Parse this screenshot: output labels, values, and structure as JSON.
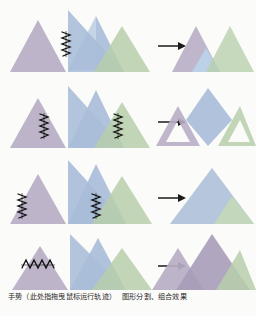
{
  "figure": {
    "title_caption": "手势（此处指拖曳鼠标运行轨迹） 图形分割、组合效果",
    "caption_part_1": "手势（此处指拖曳鼠标运行轨迹）",
    "caption_part_2": "图形分割、组合效果",
    "background_color": "#fbfbf9",
    "rows": [
      {
        "id": "row-1",
        "gesture": "single vertical zigzag scribble on blue triangle left edge",
        "gesture_count": 1,
        "source_shapes": [
          "purple-triangle",
          "blue-triangle",
          "green-triangle"
        ],
        "result_shapes": [
          "purple-triangle-with-blue-wedge",
          "green-triangle"
        ],
        "result_description": "紫色三角形（含蓝色楔形）与绿色三角形"
      },
      {
        "id": "row-2",
        "gesture": "two vertical zigzag scribbles on both blue overlaps",
        "gesture_count": 2,
        "source_shapes": [
          "purple-triangle",
          "blue-triangle",
          "green-triangle"
        ],
        "result_shapes": [
          "purple-outline-triangle",
          "blue-kite",
          "green-outline-triangle"
        ],
        "result_description": "蓝色菱形被分离，紫色与绿色成轮廓三角形"
      },
      {
        "id": "row-3",
        "gesture": "two vertical zigzag scribbles at outer left and right",
        "gesture_count": 2,
        "source_shapes": [
          "purple-triangle",
          "blue-triangle",
          "green-triangle"
        ],
        "result_shapes": [
          "blue-triangle-with-green-corner"
        ],
        "result_description": "合并为一个蓝色三角形，右下角为绿色"
      },
      {
        "id": "row-4",
        "gesture": "single horizontal zigzag scribble across purple triangle",
        "gesture_count": 1,
        "source_shapes": [
          "purple-triangle",
          "blue-triangle",
          "green-triangle"
        ],
        "result_shapes": [
          "purple-triangle",
          "purple-triangle-large",
          "green-triangle"
        ],
        "result_description": "左中两个三角形合并为紫色，右侧绿色保持"
      }
    ],
    "colors": {
      "purple": "#b9aec6",
      "purple_dark": "#a79cb8",
      "blue": "#a8bcd8",
      "blue_light": "#c2d2e6",
      "green": "#b7cfab",
      "green_light": "#cbdcc2",
      "arrow": "#1a1a1a",
      "scribble": "#111111",
      "caption_text": "#2a2a2a"
    },
    "arrow_label": "→",
    "arrow_count": 4
  }
}
